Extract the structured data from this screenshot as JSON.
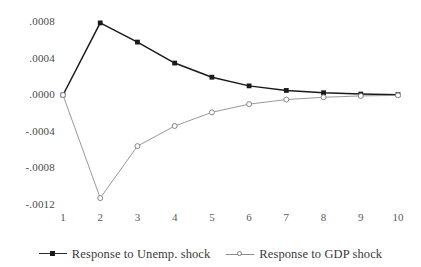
{
  "chart_data": {
    "type": "line",
    "title": "",
    "subtitle": "",
    "xlabel": "",
    "ylabel": "",
    "x": [
      1,
      2,
      3,
      4,
      5,
      6,
      7,
      8,
      9,
      10
    ],
    "xtick_labels": [
      "1",
      "2",
      "3",
      "4",
      "5",
      "6",
      "7",
      "8",
      "9",
      "10"
    ],
    "ytick_labels": [
      ".0008",
      ".0004",
      ".0000",
      "-.0004",
      "-.0008",
      "-.0012"
    ],
    "ytick_values": [
      0.0008,
      0.0004,
      0.0,
      -0.0004,
      -0.0008,
      -0.0012
    ],
    "ylim": [
      -0.0013,
      0.00092
    ],
    "xlim": [
      1,
      10
    ],
    "grid": false,
    "legend_position": "bottom",
    "series": [
      {
        "name": "Response to Unemp. shock",
        "color": "#1a1a1a",
        "marker": "filled-square",
        "values": [
          0.0,
          0.00079,
          0.00058,
          0.00035,
          0.000195,
          0.0001,
          5e-05,
          2.5e-05,
          1e-05,
          4e-06
        ]
      },
      {
        "name": "Response to GDP shock",
        "color": "#8c8c8c",
        "marker": "open-circle",
        "values": [
          0.0,
          -0.00113,
          -0.00056,
          -0.00034,
          -0.00019,
          -0.0001,
          -5e-05,
          -2.5e-05,
          -1e-05,
          -4e-06
        ]
      }
    ]
  },
  "legend": {
    "entries": [
      {
        "label": "Response to Unemp. shock"
      },
      {
        "label": "Response to GDP shock"
      }
    ]
  }
}
